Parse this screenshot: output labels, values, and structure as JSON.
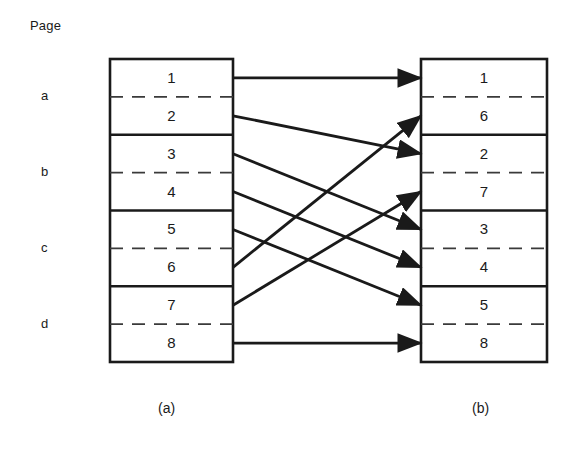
{
  "figure": {
    "header_label": "Page",
    "group_labels": [
      {
        "label": "a",
        "x": 41,
        "y": 88
      },
      {
        "label": "b",
        "x": 41,
        "y": 164
      },
      {
        "label": "c",
        "x": 41,
        "y": 240
      },
      {
        "label": "d",
        "x": 41,
        "y": 316
      }
    ],
    "captions": [
      {
        "label": "(a)",
        "x": 158,
        "y": 400
      },
      {
        "label": "(b)",
        "x": 472,
        "y": 400
      }
    ],
    "colors": {
      "ink": "#1a1a1a",
      "background": "#ffffff",
      "solid_rule": "#1a1a1a",
      "dashed_rule": "#3a3a3a"
    },
    "left_panel": {
      "name": "virtual-address-space",
      "x": 110,
      "y": 59,
      "width": 123,
      "height": 303,
      "cell_height": 37.875,
      "cells": [
        "1",
        "2",
        "3",
        "4",
        "5",
        "6",
        "7",
        "8"
      ],
      "group_size": 2
    },
    "right_panel": {
      "name": "physical-memory",
      "x": 421,
      "y": 59,
      "width": 126,
      "height": 303,
      "cell_height": 37.875,
      "cells": [
        "1",
        "6",
        "2",
        "7",
        "3",
        "4",
        "5",
        "8"
      ],
      "group_size": 2
    },
    "mapping": {
      "description": "arrow from left cell index to right cell index (0-based)",
      "arrows": [
        {
          "from": 0,
          "to": 0,
          "from_value": "1",
          "to_value": "1"
        },
        {
          "from": 1,
          "to": 2,
          "from_value": "2",
          "to_value": "2"
        },
        {
          "from": 2,
          "to": 4,
          "from_value": "3",
          "to_value": "3"
        },
        {
          "from": 3,
          "to": 5,
          "from_value": "4",
          "to_value": "4"
        },
        {
          "from": 4,
          "to": 6,
          "from_value": "5",
          "to_value": "5"
        },
        {
          "from": 5,
          "to": 1,
          "from_value": "6",
          "to_value": "6"
        },
        {
          "from": 6,
          "to": 3,
          "from_value": "7",
          "to_value": "7"
        },
        {
          "from": 7,
          "to": 7,
          "from_value": "8",
          "to_value": "8"
        }
      ]
    }
  }
}
